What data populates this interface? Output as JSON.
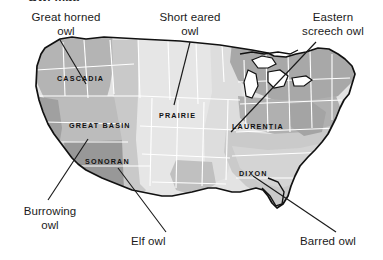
{
  "figure": {
    "type": "thematic-map",
    "title_fragment": "Owl map",
    "background_color": "#ffffff",
    "outline_color": "#111111",
    "state_border_color": "#ffffff"
  },
  "callouts": [
    {
      "id": "great-horned-owl",
      "label": "Great horned\nowl",
      "x": 14,
      "y": 11,
      "width": 104,
      "align": "center"
    },
    {
      "id": "short-eared-owl",
      "label": "Short eared\nowl",
      "x": 149,
      "y": 11,
      "width": 82,
      "align": "center"
    },
    {
      "id": "eastern-screech-owl",
      "label": "Eastern\nscreech owl",
      "x": 288,
      "y": 11,
      "width": 90,
      "align": "center"
    },
    {
      "id": "burrowing-owl",
      "label": "Burrowing\nowl",
      "x": 8,
      "y": 205,
      "width": 84,
      "align": "center"
    },
    {
      "id": "elf-owl",
      "label": "Elf owl",
      "x": 131,
      "y": 235,
      "width": 60,
      "align": "left"
    },
    {
      "id": "barred-owl",
      "label": "Barred owl",
      "x": 300,
      "y": 235,
      "width": 76,
      "align": "left"
    }
  ],
  "regions": [
    {
      "id": "cascadia",
      "label": "CASCADIA",
      "x": 57,
      "y": 74,
      "fill": "#b4b4b4"
    },
    {
      "id": "great-basin",
      "label": "GREAT BASIN",
      "x": 69,
      "y": 121,
      "fill": "#b9b9b9"
    },
    {
      "id": "sonoran",
      "label": "SONORAN",
      "x": 85,
      "y": 157,
      "fill": "#9b9b9b"
    },
    {
      "id": "prairie",
      "label": "PRAIRIE",
      "x": 159,
      "y": 111,
      "fill": "#dcdcdc"
    },
    {
      "id": "laurentia",
      "label": "LAURENTIA",
      "x": 232,
      "y": 122,
      "fill": "#a7a7a7"
    },
    {
      "id": "dixon",
      "label": "DIXON",
      "x": 239,
      "y": 169,
      "fill": "#c9c9c9"
    }
  ],
  "palette": {
    "light": "#e3e3e3",
    "light_mid": "#d2d2d2",
    "mid": "#c0c0c0",
    "mid_dark": "#ababab",
    "dark": "#979797",
    "outline": "#111111",
    "leader_line": "#1a1a1a",
    "text": "#1b1b1b"
  },
  "leader_lines": [
    {
      "id": "leader-great-horned-owl",
      "from": [
        60,
        40
      ],
      "to": [
        86,
        84
      ]
    },
    {
      "id": "leader-short-eared-owl",
      "from": [
        190,
        42
      ],
      "to": [
        174,
        105
      ]
    },
    {
      "id": "leader-eastern-screech",
      "from": [
        316,
        42
      ],
      "to": [
        231,
        132
      ]
    },
    {
      "id": "leader-burrowing-owl",
      "from": [
        48,
        200
      ],
      "to": [
        88,
        139
      ]
    },
    {
      "id": "leader-elf-owl",
      "from": [
        166,
        232
      ],
      "to": [
        118,
        168
      ]
    },
    {
      "id": "leader-barred-owl",
      "from": [
        336,
        232
      ],
      "to": [
        253,
        176
      ]
    }
  ]
}
